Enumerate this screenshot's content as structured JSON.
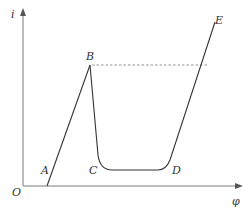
{
  "diagram": {
    "type": "current-potential curve (passivation)",
    "axes": {
      "y_label": "i",
      "x_label": "φ",
      "origin_label": "O"
    },
    "points": {
      "A": "A",
      "B": "B",
      "C": "C",
      "D": "D",
      "E": "E"
    },
    "colors": {
      "curve": "#333333",
      "axis": "#7a7a7a",
      "dashed": "#888888"
    },
    "segments": [
      "O-A baseline on φ axis",
      "A-B rising line",
      "B-C steep drop",
      "C-D flat passive region",
      "D-E rising line",
      "B-E dashed horizontal reference"
    ]
  }
}
